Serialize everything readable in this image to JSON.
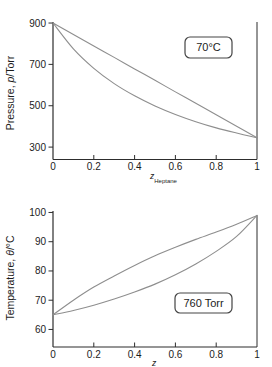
{
  "page": {
    "background": "#ffffff"
  },
  "colors": {
    "axis": "#2d2d2d",
    "curve": "#8e8e8e",
    "text": "#1c1c1c",
    "annotation_border": "#444444"
  },
  "chart_data": [
    {
      "id": "pressure-composition-chart",
      "type": "line",
      "title": "",
      "annotation": {
        "label": "70°C"
      },
      "xlabel": {
        "main": "z",
        "sub": "Heptane"
      },
      "ylabel": {
        "prefix": "Pressure, ",
        "italic": "p",
        "suffix": "/Torr"
      },
      "xlim": [
        0,
        1
      ],
      "ylim": [
        240,
        905
      ],
      "xticks": [
        0,
        0.2,
        0.4,
        0.6,
        0.8,
        1
      ],
      "xtick_labels": [
        "0",
        "0.2",
        "0.4",
        "0.6",
        "0.8",
        "1"
      ],
      "yticks": [
        300,
        500,
        700,
        900
      ],
      "ytick_labels": [
        "300",
        "500",
        "700",
        "900"
      ],
      "x": [
        0,
        0.1,
        0.2,
        0.3,
        0.4,
        0.5,
        0.6,
        0.7,
        0.8,
        0.9,
        1
      ],
      "series": [
        {
          "name": "liquid-bubble-line",
          "values": [
            900,
            845,
            789,
            734,
            678,
            623,
            567,
            512,
            456,
            401,
            345
          ]
        },
        {
          "name": "vapour-dew-line",
          "values": [
            900,
            775,
            681,
            607,
            548,
            499,
            458,
            423,
            393,
            368,
            345
          ]
        }
      ],
      "right_boundary_full_height": true,
      "grid": false,
      "legend": "none"
    },
    {
      "id": "temperature-composition-chart",
      "type": "line",
      "title": "",
      "annotation": {
        "label": "760 Torr"
      },
      "xlabel": {
        "main": "z",
        "sub": ""
      },
      "ylabel": {
        "prefix": "Temperature, ",
        "italic": "θ",
        "suffix": "/°C"
      },
      "xlim": [
        0,
        1
      ],
      "ylim": [
        54,
        100.5
      ],
      "xticks": [
        0,
        0.2,
        0.4,
        0.6,
        0.8,
        1
      ],
      "xtick_labels": [
        "0",
        "0.2",
        "0.4",
        "0.6",
        "0.8",
        "1"
      ],
      "yticks": [
        60,
        70,
        80,
        90,
        100
      ],
      "ytick_labels": [
        "60",
        "70",
        "80",
        "90",
        "100"
      ],
      "x": [
        0,
        0.1,
        0.2,
        0.3,
        0.4,
        0.5,
        0.6,
        0.7,
        0.8,
        0.9,
        1
      ],
      "series": [
        {
          "name": "liquid-bubble-line",
          "values": [
            65,
            66.5,
            68.3,
            70.4,
            72.8,
            75.5,
            78.7,
            82.4,
            86.7,
            91.8,
            99
          ]
        },
        {
          "name": "vapour-dew-line",
          "values": [
            65,
            70,
            74.5,
            78.3,
            81.9,
            85.2,
            88.1,
            90.8,
            93.3,
            96,
            99
          ]
        }
      ],
      "right_boundary_full_height": false,
      "grid": false,
      "legend": "none"
    }
  ]
}
